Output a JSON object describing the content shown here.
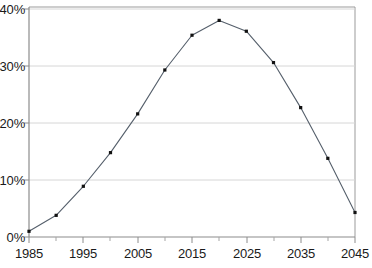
{
  "chart_data": {
    "type": "line",
    "title": "",
    "subtitle": "",
    "xlabel": "",
    "ylabel": "",
    "xlim": [
      1985,
      2045
    ],
    "ylim": [
      0,
      40
    ],
    "grid": true,
    "legend": null,
    "y_tick_labels": [
      "0%",
      "10%",
      "20%",
      "30%",
      "40%"
    ],
    "y_tick_values": [
      0,
      10,
      20,
      30,
      40
    ],
    "x_tick_labels": [
      "1985",
      "1995",
      "2005",
      "2015",
      "2025",
      "2035",
      "2045"
    ],
    "x_tick_values": [
      1985,
      1995,
      2005,
      2015,
      2025,
      2035,
      2045
    ],
    "x_minor_tick_values": [
      1990,
      2000,
      2010,
      2020,
      2030,
      2040
    ],
    "x": [
      1985,
      1990,
      1995,
      2000,
      2005,
      2010,
      2015,
      2020,
      2025,
      2030,
      2035,
      2040,
      2045
    ],
    "values": [
      1.0,
      3.8,
      8.9,
      14.8,
      21.6,
      29.3,
      35.4,
      38.0,
      36.1,
      30.6,
      22.7,
      13.8,
      4.3
    ],
    "series": [
      {
        "name": "series-1",
        "values": [
          1.0,
          3.8,
          8.9,
          14.8,
          21.6,
          29.3,
          35.4,
          38.0,
          36.1,
          30.6,
          22.7,
          13.8,
          4.3
        ]
      }
    ],
    "marker": "square",
    "line_color": "#555f6b",
    "marker_color": "#111111",
    "grid_color": "#d9d9d9",
    "axis_color": "#8c8c8c",
    "frame_color": "#999999",
    "background_color": "#ffffff"
  }
}
